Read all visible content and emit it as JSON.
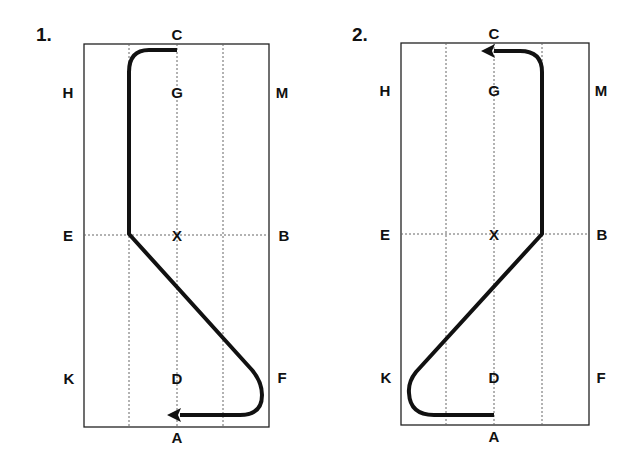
{
  "colors": {
    "path": "#111111",
    "frame": "#222222",
    "grid": "#666666",
    "text": "#111111",
    "background": "#ffffff"
  },
  "panels": [
    {
      "number": "1.",
      "labels": {
        "C": "C",
        "G": "G",
        "H": "H",
        "M": "M",
        "E": "E",
        "X": "X",
        "B": "B",
        "K": "K",
        "D": "D",
        "F": "F",
        "A": "A"
      },
      "description": "Path from C curving left to the left quarter line, down to E-line, diagonal to F, looping back toward A with arrow"
    },
    {
      "number": "2.",
      "labels": {
        "C": "C",
        "G": "G",
        "H": "H",
        "M": "M",
        "E": "E",
        "X": "X",
        "B": "B",
        "K": "K",
        "D": "D",
        "F": "F",
        "A": "A"
      },
      "description": "Path from A going left to K, diagonal up to B-line at right quarter line, up and curving left toward C with arrow"
    }
  ]
}
